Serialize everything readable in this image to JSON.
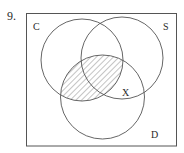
{
  "problem_number": "9.",
  "diagram": {
    "type": "venn",
    "universe": {
      "x": 26.5,
      "y": 13.5,
      "width": 150,
      "height": 132.5
    },
    "sets": [
      {
        "name": "C",
        "label": "C",
        "cx": 82,
        "cy": 60,
        "r": 41,
        "label_x": 33,
        "label_y": 30
      },
      {
        "name": "S",
        "label": "S",
        "cx": 122,
        "cy": 58,
        "r": 41,
        "label_x": 163,
        "label_y": 30
      },
      {
        "name": "D",
        "label": "D",
        "cx": 102.5,
        "cy": 97,
        "r": 42,
        "label_x": 151,
        "label_y": 138
      }
    ],
    "shaded_region": "C ∩ D",
    "region_marker": {
      "label": "X",
      "region": "S ∩ D − C",
      "x": 122,
      "y": 96
    },
    "stroke_color": "#555555",
    "hatch_color": "#8a8a8a"
  }
}
